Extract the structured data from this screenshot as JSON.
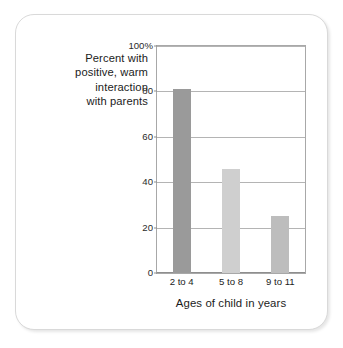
{
  "chart_data": {
    "type": "bar",
    "title": "",
    "subtitle": "",
    "categories": [
      "2 to 4",
      "5 to 8",
      "9 to 11"
    ],
    "values": [
      81,
      46,
      25
    ],
    "series": [
      {
        "name": "Percent with positive, warm interaction with parents",
        "values": [
          81,
          46,
          25
        ]
      }
    ],
    "bar_colors": [
      "#9a9a9a",
      "#cfcfcf",
      "#bdbdbd"
    ],
    "xlabel": "Ages of child in years",
    "ylabel": "Percent with positive, warm interaction with parents",
    "ylabel_lines": [
      "Percent with",
      "positive, warm",
      "interaction",
      "with parents"
    ],
    "ylim": [
      0,
      100
    ],
    "ytick_values": [
      0,
      20,
      40,
      60,
      80,
      100
    ],
    "ytick_labels": [
      "0",
      "20",
      "40",
      "60",
      "80",
      "100%"
    ],
    "grid": true,
    "legend": "none",
    "bar_width_fraction": 0.36
  },
  "colors": {
    "card_border": "#d9d9d9",
    "plot_border": "#a8a8a8",
    "gridline": "#b4b4b4",
    "text": "#1b1b1b",
    "background": "#ffffff"
  }
}
